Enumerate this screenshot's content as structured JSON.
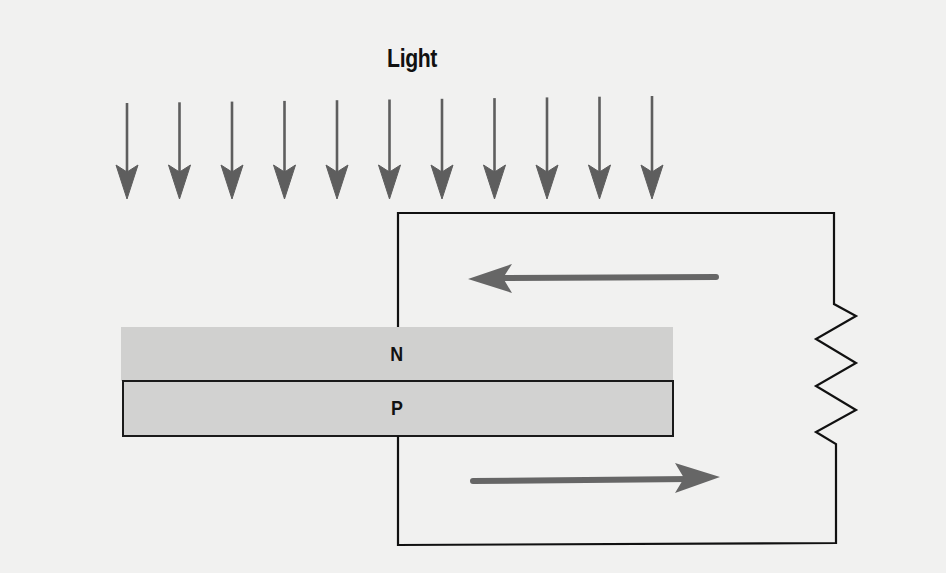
{
  "diagram": {
    "title": "Light",
    "layers": [
      {
        "label": "N",
        "color": "#d0d0cf"
      },
      {
        "label": "P",
        "color": "#d2d2d1"
      }
    ],
    "light_arrows": {
      "count": 11,
      "color": "#5e5e5e"
    },
    "current_arrows": [
      {
        "direction": "left",
        "position": "top"
      },
      {
        "direction": "right",
        "position": "bottom"
      }
    ],
    "circuit": {
      "elements": [
        "wire",
        "resistor"
      ],
      "line_color": "#111111"
    },
    "colors": {
      "background": "#f1f1f0",
      "arrow": "#666666"
    }
  }
}
